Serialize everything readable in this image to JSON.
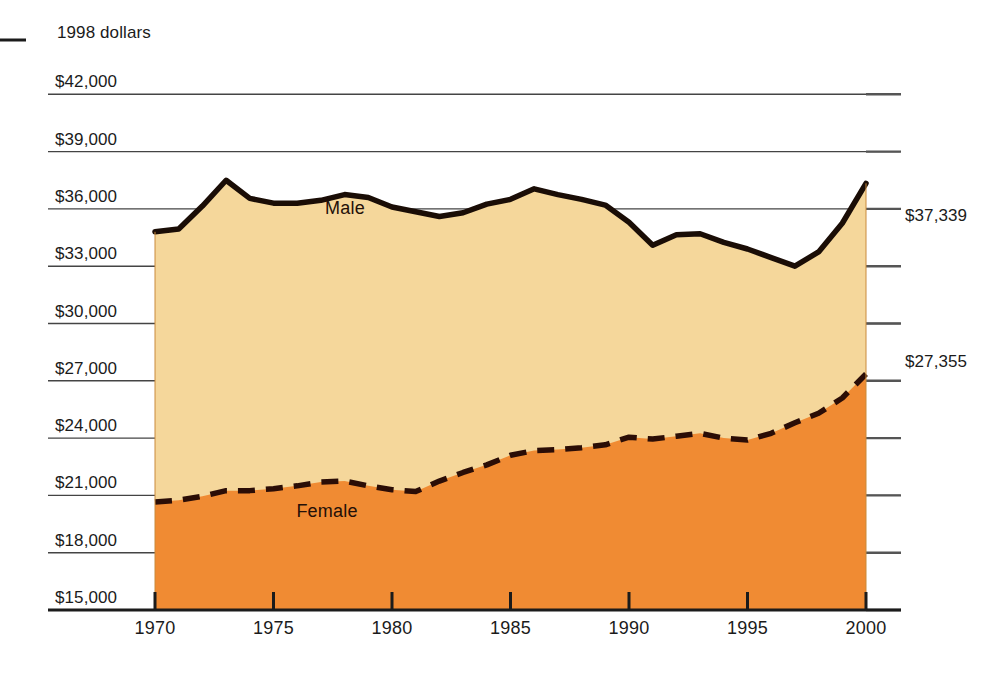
{
  "chart_data": {
    "type": "area",
    "title": "",
    "subtitle": "",
    "units_note": "1998 dollars",
    "xlabel": "",
    "ylabel": "",
    "stacked": false,
    "grid": true,
    "legend_position": "inline-annotations",
    "xlim": [
      1970,
      2000
    ],
    "ylim": [
      15000,
      42000
    ],
    "x_ticks": [
      "1970",
      "1975",
      "1980",
      "1985",
      "1990",
      "1995",
      "2000"
    ],
    "x_tick_values": [
      1970,
      1975,
      1980,
      1985,
      1990,
      1995,
      2000
    ],
    "y_ticks": [
      "$15,000",
      "$18,000",
      "$21,000",
      "$24,000",
      "$27,000",
      "$30,000",
      "$33,000",
      "$36,000",
      "$39,000",
      "$42,000"
    ],
    "y_tick_values": [
      15000,
      18000,
      21000,
      24000,
      27000,
      30000,
      33000,
      36000,
      39000,
      42000
    ],
    "x": [
      1970,
      1971,
      1972,
      1973,
      1974,
      1975,
      1976,
      1977,
      1978,
      1979,
      1980,
      1981,
      1982,
      1983,
      1984,
      1985,
      1986,
      1987,
      1988,
      1989,
      1990,
      1991,
      1992,
      1993,
      1994,
      1995,
      1996,
      1997,
      1998,
      1999,
      2000
    ],
    "series": [
      {
        "name": "Male",
        "label": "Male",
        "line_style": "solid",
        "line_color": "#1a0d06",
        "fill_color": "#F5D79B",
        "end_label": "$37,339",
        "values": [
          34800,
          34950,
          36150,
          37500,
          36550,
          36300,
          36300,
          36450,
          36750,
          36600,
          36100,
          35850,
          35600,
          35800,
          36250,
          36500,
          37050,
          36750,
          36500,
          36200,
          35300,
          34100,
          34650,
          34700,
          34250,
          33900,
          33450,
          33000,
          33750,
          35250,
          37339
        ]
      },
      {
        "name": "Female",
        "label": "Female",
        "line_style": "dashed",
        "line_color": "#2b0d06",
        "fill_color": "#F08B33",
        "end_label": "$27,355",
        "values": [
          20650,
          20750,
          20950,
          21250,
          21250,
          21350,
          21500,
          21700,
          21750,
          21500,
          21300,
          21200,
          21750,
          22200,
          22600,
          23100,
          23350,
          23400,
          23500,
          23650,
          24050,
          23950,
          24100,
          24250,
          24000,
          23900,
          24250,
          24800,
          25300,
          26100,
          27355
        ]
      }
    ]
  },
  "axis": {
    "left_marker": "dash"
  }
}
